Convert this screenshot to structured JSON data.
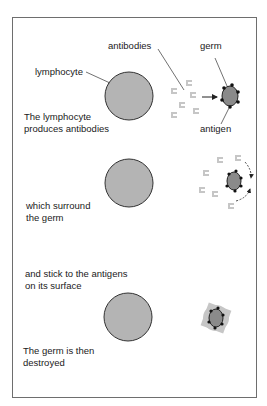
{
  "labels": {
    "antibodies": "antibodies",
    "germ": "germ",
    "lymphocyte": "lymphocyte",
    "antigen": "antigen"
  },
  "steps": [
    {
      "line1": "The lymphocyte",
      "line2": "produces antibodies"
    },
    {
      "line1": "which surround",
      "line2": "the germ"
    },
    {
      "line1": "and stick to the antigens",
      "line2": "on its surface"
    },
    {
      "line1": "The germ is then",
      "line2": "destroyed"
    }
  ],
  "colors": {
    "cell_fill": "#b4b4b4",
    "germ_fill": "#8a8a8a",
    "antibody": "#c6c6c6",
    "outline": "#333333",
    "frame": "#6e6e6e"
  }
}
